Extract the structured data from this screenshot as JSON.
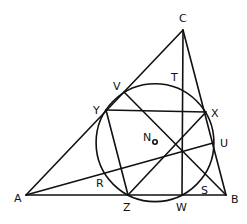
{
  "diagram": {
    "stroke_color": "#111111",
    "background": "#ffffff",
    "points": {
      "A": {
        "label": "A",
        "x": 26,
        "y": 195,
        "lx": 14,
        "ly": 202
      },
      "B": {
        "label": "B",
        "x": 226,
        "y": 195,
        "lx": 231,
        "ly": 203
      },
      "C": {
        "label": "C",
        "x": 183,
        "y": 30,
        "lx": 179,
        "ly": 22
      },
      "V": {
        "label": "V",
        "x": 124,
        "y": 92,
        "lx": 113,
        "ly": 90
      },
      "Y": {
        "label": "Y",
        "x": 106,
        "y": 110,
        "lx": 93,
        "ly": 114
      },
      "X": {
        "label": "X",
        "x": 206,
        "y": 112,
        "lx": 211,
        "ly": 117
      },
      "U": {
        "label": "U",
        "x": 213,
        "y": 143,
        "lx": 220,
        "ly": 147
      },
      "T": {
        "label": "T",
        "x": 183,
        "y": 86,
        "lx": 171,
        "ly": 81
      },
      "N": {
        "label": "N",
        "x": 155,
        "y": 142,
        "lx": 143,
        "ly": 141
      },
      "R": {
        "label": "R",
        "x": 104,
        "y": 170,
        "lx": 96,
        "ly": 187
      },
      "S": {
        "label": "S",
        "x": 201,
        "y": 182,
        "lx": 201,
        "ly": 194
      },
      "Z": {
        "label": "Z",
        "x": 128,
        "y": 195,
        "lx": 123,
        "ly": 211
      },
      "W": {
        "label": "W",
        "x": 182,
        "y": 195,
        "lx": 176,
        "ly": 211
      }
    },
    "circle": {
      "cx": 155,
      "cy": 142.7,
      "r": 58.9
    },
    "segments": [
      [
        "A",
        "B"
      ],
      [
        "B",
        "C"
      ],
      [
        "C",
        "A"
      ],
      [
        "C",
        "W"
      ],
      [
        "A",
        "U"
      ],
      [
        "B",
        "V"
      ],
      [
        "Y",
        "X"
      ],
      [
        "Y",
        "Z"
      ],
      [
        "Z",
        "X"
      ]
    ]
  }
}
